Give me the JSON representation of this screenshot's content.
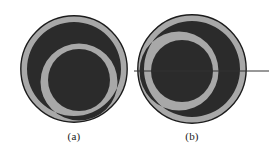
{
  "figure": {
    "background_color": "#ffffff",
    "outline_color": "#1c1c1c",
    "disc_fill_color": "#a8a8a8",
    "dark_fill_color": "#2b2b2b",
    "axis_line_color": "#333333",
    "panels": [
      {
        "id": "a",
        "label": "(a)",
        "outer_circle": {
          "cx": 74,
          "cy": 69,
          "r": 54
        },
        "inner_circle": {
          "cx": 79,
          "cy": 80,
          "r": 31
        },
        "crescent_orientation_deg": 0,
        "has_axis_line": false
      },
      {
        "id": "b",
        "label": "(b)",
        "outer_circle": {
          "cx": 192,
          "cy": 69,
          "r": 55
        },
        "inner_circle": {
          "cx": 182,
          "cy": 71,
          "r": 31
        },
        "crescent_orientation_deg": 90,
        "has_axis_line": true
      }
    ],
    "axis_line": {
      "x1": 134,
      "x2": 269,
      "y": 71,
      "stroke_width": 1
    }
  }
}
